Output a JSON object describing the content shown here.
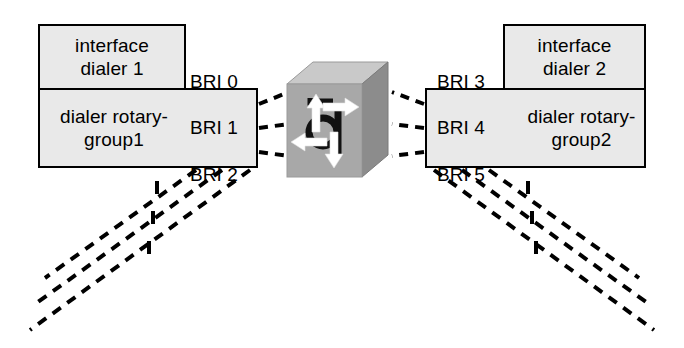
{
  "diagram": {
    "background_color": "#ffffff",
    "box_fill_color": "#e9e9e9",
    "box_border_color": "#000000",
    "line_color": "#000000",
    "cube_front_color": "#a8a8a8",
    "cube_top_color": "#c9c9c9",
    "cube_side_color": "#8e8e8e",
    "arrow_color": "#ffffff"
  },
  "left": {
    "interface_box": {
      "label": "interface\ndialer 1"
    },
    "rotary_box": {
      "group_label": "dialer rotary-\ngroup1",
      "interfaces": [
        "BRI 0",
        "BRI 1",
        "BRI 2"
      ]
    }
  },
  "right": {
    "interface_box": {
      "label": "interface\ndialer 2"
    },
    "rotary_box": {
      "group_label": "dialer rotary-\ngroup2",
      "interfaces": [
        "BRI 3",
        "BRI 4",
        "BRI 5"
      ]
    }
  },
  "center": {
    "device_name": "multilayer-switch-icon",
    "arrow_count": 4
  },
  "connections": {
    "left_to_switch_count": 3,
    "right_to_switch_count": 3,
    "left_trunk_count": 3,
    "right_trunk_count": 3,
    "dash_pattern": "9 7",
    "stroke_width": 4
  }
}
